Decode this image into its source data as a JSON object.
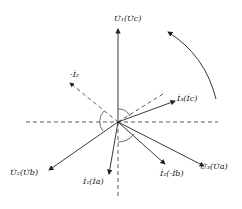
{
  "diagram": {
    "type": "phasor-diagram",
    "labels": {
      "u1": "U̇₁(U̇c)",
      "u2": "U̇₂(U̇b)",
      "u3": "U̇₃(U̇a)",
      "i1": "İ₁(İa)",
      "i2": "İ₂(-İb)",
      "i3": "İ₃(İc)",
      "neg_i2": "-İ₂"
    },
    "rotation_arrow": "counterclockwise"
  }
}
